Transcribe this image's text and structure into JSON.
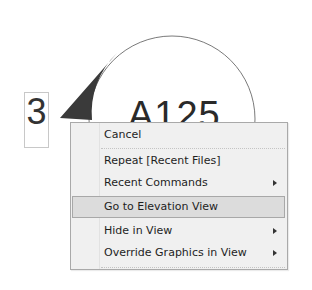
{
  "drawing": {
    "elevation_tag": {
      "number": "3",
      "view_label": "A125",
      "circle_color": "#7a7a7a",
      "pointer_color": "#3a3a3a"
    }
  },
  "context_menu": {
    "items": [
      {
        "label": "Cancel",
        "has_submenu": false,
        "highlighted": false
      },
      {
        "label": "Repeat [Recent Files]",
        "has_submenu": false,
        "highlighted": false
      },
      {
        "label": "Recent Commands",
        "has_submenu": true,
        "highlighted": false
      },
      {
        "label": "Go to Elevation View",
        "has_submenu": false,
        "highlighted": true
      },
      {
        "label": "Hide in View",
        "has_submenu": true,
        "highlighted": false
      },
      {
        "label": "Override Graphics in View",
        "has_submenu": true,
        "highlighted": false
      }
    ],
    "submenu_icon": "triangle-right"
  }
}
